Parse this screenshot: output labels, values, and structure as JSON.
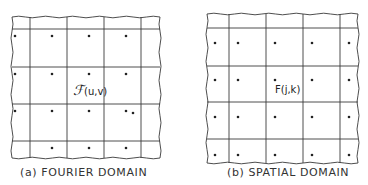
{
  "figure": {
    "panels": [
      {
        "id": "a",
        "caption": "(a) FOURIER DOMAIN",
        "label_script": "ℱ",
        "label_args": "(u,v)",
        "bounds": {
          "left": 12,
          "right": 160,
          "top": 17,
          "bottom": 158
        },
        "vlines": [
          30,
          67,
          104,
          141
        ],
        "hlines": [
          29,
          67,
          104,
          141
        ],
        "dots": [
          [
            15,
            36
          ],
          [
            52,
            36
          ],
          [
            89,
            36
          ],
          [
            126,
            36
          ],
          [
            15,
            74
          ],
          [
            52,
            74
          ],
          [
            89,
            74
          ],
          [
            126,
            74
          ],
          [
            15,
            111
          ],
          [
            52,
            111
          ],
          [
            89,
            111
          ],
          [
            126,
            111
          ],
          [
            133,
            113
          ],
          [
            52,
            148
          ],
          [
            89,
            148
          ],
          [
            126,
            148
          ]
        ]
      },
      {
        "id": "b",
        "caption": "(b) SPATIAL DOMAIN",
        "label_text": "F(j,k)",
        "bounds": {
          "left": 207,
          "right": 358,
          "top": 14,
          "bottom": 163
        },
        "vlines": [
          229,
          266,
          303,
          340
        ],
        "hlines": [
          28,
          66,
          102,
          139
        ],
        "dots": [
          [
            215,
            43
          ],
          [
            238,
            43
          ],
          [
            275,
            43
          ],
          [
            312,
            43
          ],
          [
            349,
            43
          ],
          [
            215,
            80
          ],
          [
            238,
            80
          ],
          [
            275,
            80
          ],
          [
            312,
            80
          ],
          [
            349,
            80
          ],
          [
            215,
            117
          ],
          [
            238,
            117
          ],
          [
            275,
            117
          ],
          [
            312,
            117
          ],
          [
            349,
            117
          ],
          [
            215,
            155
          ],
          [
            238,
            155
          ],
          [
            275,
            155
          ],
          [
            312,
            155
          ],
          [
            349,
            155
          ]
        ]
      }
    ],
    "colors": {
      "line": "#3a3a3a",
      "dot": "#222222",
      "background": "#ffffff"
    }
  }
}
